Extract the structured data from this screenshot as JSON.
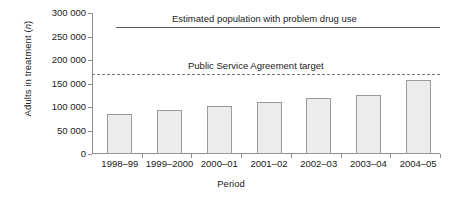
{
  "chart_data": {
    "type": "bar",
    "title": "",
    "xlabel": "Period",
    "ylabel_prefix": "Adults in treatment (",
    "ylabel_italic": "n",
    "ylabel_suffix": ")",
    "categories": [
      "1998–99",
      "1999–2000",
      "2000–01",
      "2001–02",
      "2002–03",
      "2003–04",
      "2004–05"
    ],
    "values": [
      85000,
      93000,
      102000,
      110000,
      120000,
      125000,
      158000
    ],
    "ylim": [
      0,
      300000
    ],
    "yticks": [
      0,
      50000,
      100000,
      150000,
      200000,
      250000,
      300000
    ],
    "ytick_labels": [
      "0",
      "50 000",
      "100 000",
      "150 000",
      "200 000",
      "250 000",
      "300 000"
    ],
    "grid": false,
    "legend": "none",
    "bar_fill": "#ececec",
    "bar_edge": "#9a9a9a",
    "axis_color": "#8d8d8d",
    "annotations": [
      {
        "name": "estimated-population-line",
        "label": "Estimated population with problem drug use",
        "value": 270000,
        "style": "solid",
        "color": "#5a5a5a",
        "x_start_fraction": 0.07,
        "x_end_fraction": 1.0
      },
      {
        "name": "psa-target-line",
        "label": "Public Service Agreement target",
        "value": 170000,
        "style": "dashed",
        "color": "#7a7a7a",
        "x_start_fraction": 0.0,
        "x_end_fraction": 1.0
      }
    ]
  }
}
